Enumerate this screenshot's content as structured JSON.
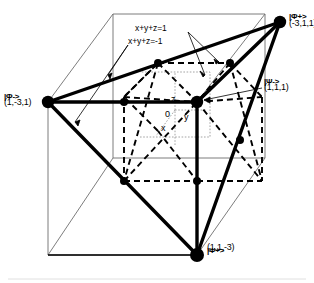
{
  "figure": {
    "colors": {
      "ink": "#000000",
      "outer_cube": "#6e6e6e",
      "axis": "#9a9a9a",
      "background": "#ffffff"
    },
    "vertices": [
      {
        "id": "phi_plus",
        "ket": "|Φ+>",
        "coord": "(-3,1,1)",
        "x": 280,
        "y": 22
      },
      {
        "id": "phi_minus",
        "ket": "|Φ->",
        "coord": "(1,-3,1)",
        "x": 48,
        "y": 102
      },
      {
        "id": "psi_minus",
        "ket": "|Ψ->",
        "coord": "(1,1,1)",
        "x": 197,
        "y": 102
      },
      {
        "id": "psi_plus",
        "ket": "|Ψ+>",
        "coord": "(1,1,-3)",
        "x": 197,
        "y": 255
      }
    ],
    "planes": [
      {
        "id": "plane_pos",
        "equation": "x+y+z=1"
      },
      {
        "id": "plane_neg",
        "equation": "x+y+z=-1"
      }
    ],
    "axes": [
      {
        "id": "axis_x",
        "label": "x"
      },
      {
        "id": "axis_y",
        "label": "y"
      },
      {
        "id": "axis_z",
        "label": "z"
      },
      {
        "id": "origin",
        "label": "0"
      }
    ]
  }
}
